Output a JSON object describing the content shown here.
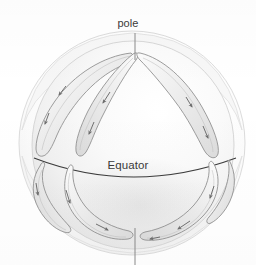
{
  "figure": {
    "type": "cutaway-sphere-diagram",
    "background_color": "#ffffff"
  },
  "labels": {
    "pole": "pole",
    "equator": "Equator"
  },
  "colors": {
    "background": "#ffffff",
    "sphere_fill_light": "#fbfbfb",
    "sphere_fill_mid": "#f1f1f1",
    "sphere_fill_shade": "#e4e4e4",
    "outer_shell_stroke": "#d8d8d8",
    "cell_fill": "#e9e9e9",
    "cell_stroke": "#8d8d8d",
    "equator_stroke": "#3c3c3c",
    "axis_line_stroke": "#8a8a8a",
    "arrow_color": "#6f6f6f",
    "text": "#3a3a3a",
    "highlight": "#ffffff"
  },
  "geometry": {
    "sphere_center_x": 132,
    "sphere_center_y": 145,
    "sphere_radius_x": 112,
    "sphere_radius_y": 113,
    "inner_sphere_radius_x": 100,
    "inner_sphere_radius_y": 105,
    "north_pole_x": 135,
    "north_pole_y": 52,
    "south_pole_x": 135,
    "south_pole_y": 228,
    "specular_highlight_x": 158,
    "specular_highlight_y": 113,
    "equator_left_x": 34,
    "equator_right_x": 236,
    "equator_mid_y": 176
  },
  "axis_lines": [
    {
      "name": "north-pole-leader",
      "x1": 135,
      "y1": 33,
      "x2": 135,
      "y2": 60
    },
    {
      "name": "south-pole-leader",
      "x1": 135,
      "y1": 228,
      "x2": 135,
      "y2": 265
    }
  ],
  "convection_cells": [
    {
      "id": "upper-left",
      "hemisphere": "north",
      "position": "left",
      "flow": "poleward-then-down"
    },
    {
      "id": "upper-center-left",
      "hemisphere": "north",
      "position": "center-left",
      "flow": "poleward-then-down"
    },
    {
      "id": "upper-right",
      "hemisphere": "north",
      "position": "right",
      "flow": "poleward-then-down"
    },
    {
      "id": "lower-left",
      "hemisphere": "south",
      "position": "left",
      "flow": "equatorward-then-up"
    },
    {
      "id": "lower-center",
      "hemisphere": "south",
      "position": "center",
      "flow": "equatorward-then-up"
    },
    {
      "id": "lower-right",
      "hemisphere": "south",
      "position": "right",
      "flow": "equatorward-then-up"
    }
  ],
  "arrow_count": 12
}
